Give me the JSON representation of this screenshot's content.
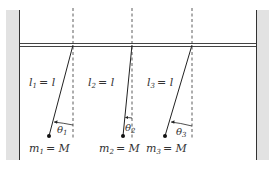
{
  "diagram": {
    "type": "three coupled pendulums hanging from a horizontal bar between two walls",
    "colors": {
      "wall_fill": "#e2e2e2",
      "wall_edge": "#333333",
      "line": "#222222",
      "bar": "#444444",
      "background": "#ffffff"
    },
    "pendulums": [
      {
        "length_label": {
          "var": "l",
          "sub": "1",
          "eq": "= l"
        },
        "mass_label": {
          "var": "m",
          "sub": "1",
          "eq": "= M"
        },
        "angle_label": {
          "var": "θ",
          "sub": "1"
        },
        "pivot": [
          73,
          45
        ],
        "bob": [
          49,
          136
        ]
      },
      {
        "length_label": {
          "var": "l",
          "sub": "2",
          "eq": "= l"
        },
        "mass_label": {
          "var": "m",
          "sub": "2",
          "eq": "= M"
        },
        "angle_label": {
          "var": "θ",
          "sub": "2"
        },
        "pivot": [
          132,
          45
        ],
        "bob": [
          123,
          136
        ]
      },
      {
        "length_label": {
          "var": "l",
          "sub": "3",
          "eq": "= l"
        },
        "mass_label": {
          "var": "m",
          "sub": "3",
          "eq": "= M"
        },
        "angle_label": {
          "var": "θ",
          "sub": "3"
        },
        "pivot": [
          192,
          45
        ],
        "bob": [
          165,
          136
        ]
      }
    ]
  }
}
